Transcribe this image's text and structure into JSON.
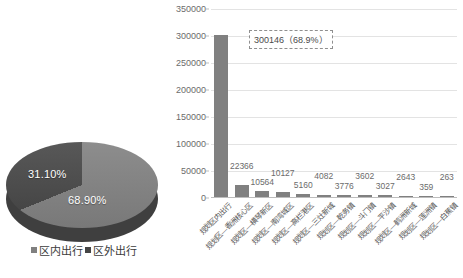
{
  "chart_data": [
    {
      "type": "pie",
      "title": "",
      "labels": [
        "区内出行",
        "区外出行"
      ],
      "values": [
        68.9,
        31.1
      ],
      "value_labels": [
        "68.90%",
        "31.10%"
      ],
      "unit": "%",
      "legend_position": "bottom",
      "colors": [
        "#808080",
        "#454545"
      ],
      "three_d": true
    },
    {
      "type": "bar",
      "title": "",
      "xlabel": "",
      "ylabel": "",
      "ylim": [
        0,
        350000
      ],
      "ytick_step": 50000,
      "ytick_labels": [
        "0",
        "50000",
        "100000",
        "150000",
        "200000",
        "250000",
        "300000",
        "350000"
      ],
      "grid": true,
      "bar_color": "#808080",
      "categories": [
        "规划区内出行",
        "规划区—香洲核心区",
        "规划区—横琴新区",
        "规划区—南湾城区",
        "规划区—高栏港区",
        "规划区—三灶新城",
        "规划区—乾务镇",
        "规划区—斗门镇",
        "规划区—平沙镇",
        "规划区—鹤洲新城",
        "规划区—莲洲镇",
        "规划区—白蕉镇"
      ],
      "values": [
        300146,
        22366,
        10564,
        10127,
        5160,
        4082,
        3776,
        3602,
        3027,
        2643,
        359,
        263
      ],
      "value_labels": [
        "300146",
        "22366",
        "10564",
        "10127",
        "5160",
        "4082",
        "3776",
        "3602",
        "3027",
        "2643",
        "359",
        "263"
      ],
      "annotation": {
        "text": "300146（68.9%）",
        "style": "dashed-box",
        "target_category": "规划区内出行"
      }
    }
  ],
  "pie": {
    "slice_outside": "31.10%",
    "slice_inside": "68.90%",
    "legend": [
      {
        "label": "区内出行",
        "color": "#808080"
      },
      {
        "label": "区外出行",
        "color": "#454545"
      }
    ]
  }
}
